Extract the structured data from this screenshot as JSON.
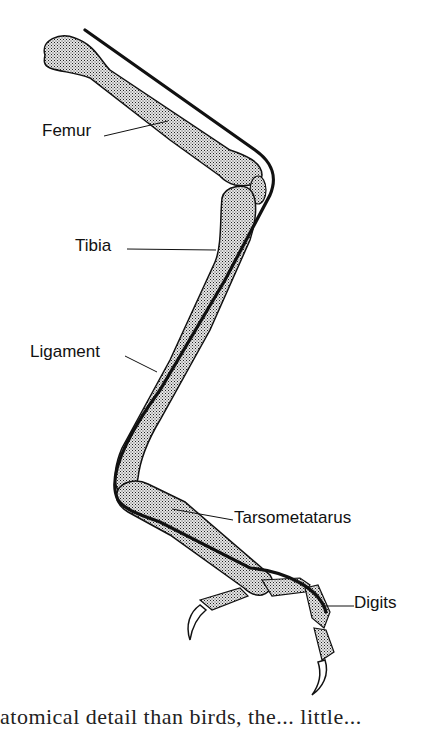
{
  "figure": {
    "colors": {
      "background": "#ffffff",
      "ink": "#111111",
      "bone_fill": "#b8b8b8"
    },
    "labels": [
      {
        "id": "femur",
        "text": "Femur"
      },
      {
        "id": "tibia",
        "text": "Tibia"
      },
      {
        "id": "ligament",
        "text": "Ligament"
      },
      {
        "id": "tarsometatarus",
        "text": "Tarsometatarus"
      },
      {
        "id": "digits",
        "text": "Digits"
      }
    ]
  },
  "caption": {
    "text": "atomical detail than birds, the... little... "
  }
}
